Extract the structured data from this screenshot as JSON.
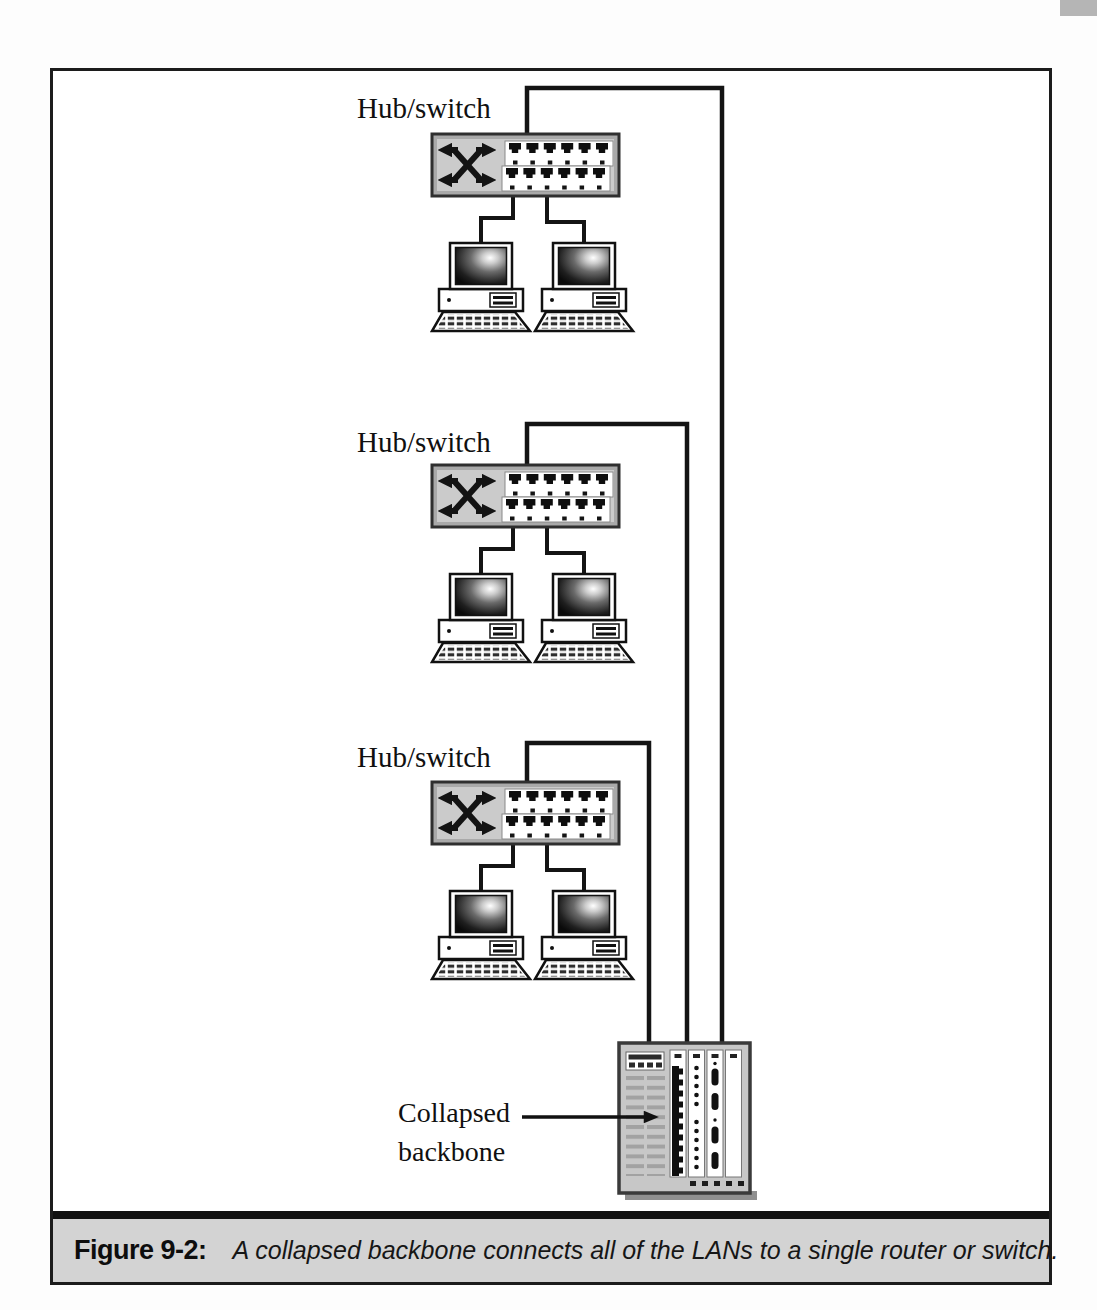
{
  "figure": {
    "caption": {
      "label": "Figure 9-2:",
      "text": "A collapsed backbone connects all of the LANs to a single router or switch."
    }
  },
  "diagram": {
    "type": "network-topology",
    "hubs": [
      {
        "label": "Hub/switch",
        "connected_pcs": 2,
        "uplink": "collapsed-backbone"
      },
      {
        "label": "Hub/switch",
        "connected_pcs": 2,
        "uplink": "collapsed-backbone"
      },
      {
        "label": "Hub/switch",
        "connected_pcs": 2,
        "uplink": "collapsed-backbone"
      }
    ],
    "backbone": {
      "label": [
        "Collapsed",
        "backbone"
      ],
      "device": "router-or-switch-chassis",
      "incoming_connections": 3
    }
  },
  "colors": {
    "line": "#141414",
    "switch_body": "#cbcbcb",
    "switch_frame": "#a9a9a9",
    "chassis_body": "#c7c7c7",
    "caption_band": "#d3d3d3",
    "page_decoration": "#b5b5b5"
  }
}
